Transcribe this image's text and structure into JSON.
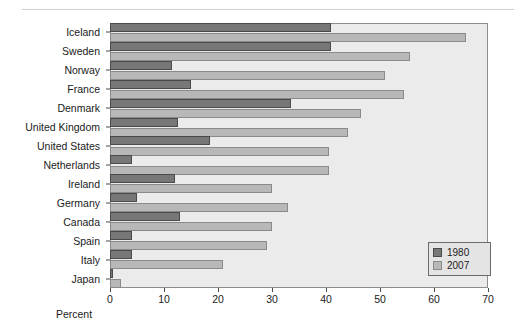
{
  "chart_data": {
    "type": "bar",
    "orientation": "horizontal",
    "title": "",
    "xlabel": "Percent",
    "ylabel": "",
    "xlim": [
      0,
      70
    ],
    "xticks": [
      0,
      10,
      20,
      30,
      40,
      50,
      60,
      70
    ],
    "grid": false,
    "legend_position": "bottom-right",
    "categories": [
      "Iceland",
      "Sweden",
      "Norway",
      "France",
      "Denmark",
      "United Kingdom",
      "United States",
      "Netherlands",
      "Ireland",
      "Germany",
      "Canada",
      "Spain",
      "Italy",
      "Japan"
    ],
    "series": [
      {
        "name": "1980",
        "color": "#777777",
        "values": [
          41,
          41,
          11.5,
          15,
          33.5,
          12.5,
          18.5,
          4,
          12,
          5,
          13,
          4,
          4,
          0.5
        ]
      },
      {
        "name": "2007",
        "color": "#b8b8b8",
        "values": [
          66,
          55.5,
          51,
          54.5,
          46.5,
          44,
          40.5,
          40.5,
          30,
          33,
          30,
          29,
          21,
          2
        ]
      }
    ]
  },
  "legend": {
    "items": [
      {
        "label": "1980",
        "swatch": "dark-gray-swatch"
      },
      {
        "label": "2007",
        "swatch": "light-gray-swatch"
      }
    ]
  },
  "axis": {
    "x_title": "Percent",
    "tick_labels": [
      "0",
      "10",
      "20",
      "30",
      "40",
      "50",
      "60",
      "70"
    ]
  }
}
